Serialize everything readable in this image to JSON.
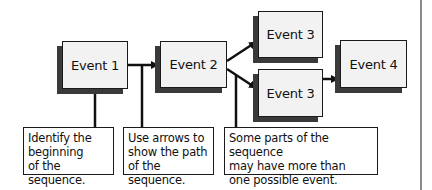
{
  "diagram": {
    "type": "sequence-chain",
    "events": [
      {
        "id": "e1",
        "label": "Event 1"
      },
      {
        "id": "e2",
        "label": "Event 2"
      },
      {
        "id": "e3a",
        "label": "Event 3"
      },
      {
        "id": "e3b",
        "label": "Event 3"
      },
      {
        "id": "e4",
        "label": "Event 4"
      }
    ],
    "edges": [
      {
        "from": "e1",
        "to": "e2"
      },
      {
        "from": "e2",
        "to": "e3a"
      },
      {
        "from": "e2",
        "to": "e3b"
      },
      {
        "from": "e3b",
        "to": "e4"
      }
    ],
    "notes": [
      {
        "id": "n1",
        "text": "Identify the\nbeginning\nof the sequence.",
        "points_to": "e1"
      },
      {
        "id": "n2",
        "text": "Use arrows to\nshow the path\nof the sequence.",
        "points_to": "e1-e2 arrow"
      },
      {
        "id": "n3",
        "text": "Some parts of the sequence\nmay have more than\none possible event.",
        "points_to": "e2-e3b arrow"
      }
    ],
    "colors": {
      "box_fill": "#f2f2f2",
      "box_border": "#1a1a1a",
      "shadow": "#3a3a3a",
      "line": "#111111",
      "side_rule": "#8a8a8a"
    }
  }
}
